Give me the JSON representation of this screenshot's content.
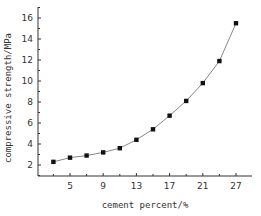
{
  "chart_data": {
    "type": "line",
    "title": "",
    "xlabel": "cement percent/%",
    "ylabel": "compressive strength/MPa",
    "x": [
      3,
      5,
      7,
      9,
      11,
      13,
      15,
      17,
      19,
      21,
      23,
      25
    ],
    "series": [
      {
        "name": "compressive strength",
        "marker": "square",
        "values": [
          2.3,
          2.7,
          2.9,
          3.2,
          3.6,
          4.4,
          5.4,
          6.7,
          8.1,
          9.8,
          11.9,
          15.5
        ]
      }
    ],
    "xticks": [
      {
        "value": 5,
        "label": "5"
      },
      {
        "value": 9,
        "label": "9"
      },
      {
        "value": 13,
        "label": "13"
      },
      {
        "value": 17,
        "label": "17"
      },
      {
        "value": 21,
        "label": "21"
      },
      {
        "value": 25,
        "label": "27"
      }
    ],
    "yticks": [
      2,
      4,
      6,
      8,
      10,
      12,
      14,
      16
    ],
    "xlim": [
      1,
      28
    ],
    "ylim": [
      0.9,
      17.2
    ],
    "grid": false,
    "legend": null,
    "colors": {
      "line": "#888888",
      "marker": "#111111",
      "axis": "#333333"
    }
  }
}
